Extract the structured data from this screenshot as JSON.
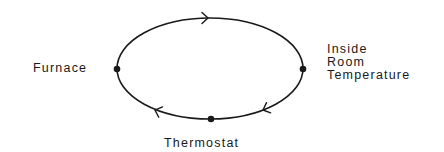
{
  "diagram": {
    "type": "feedback-loop",
    "nodes": [
      {
        "id": "furnace",
        "label": "Furnace",
        "position": "left"
      },
      {
        "id": "inside-room-temperature",
        "label_lines": [
          "Inside",
          "Room",
          "Temperature"
        ],
        "position": "right"
      },
      {
        "id": "thermostat",
        "label": "Thermostat",
        "position": "bottom"
      }
    ],
    "edges": [
      {
        "from": "furnace",
        "to": "inside-room-temperature",
        "direction": "clockwise",
        "arrow_location": "top"
      },
      {
        "from": "inside-room-temperature",
        "to": "thermostat",
        "direction": "clockwise",
        "arrow_location": "bottom-right"
      },
      {
        "from": "thermostat",
        "to": "furnace",
        "direction": "clockwise",
        "arrow_location": "bottom-left"
      }
    ],
    "colors": {
      "stroke": "#1a1a1a",
      "background": "#ffffff"
    }
  },
  "labels": {
    "furnace": "Furnace",
    "inside": [
      "Inside",
      "Room",
      "Temperature"
    ],
    "thermostat": "Thermostat"
  }
}
